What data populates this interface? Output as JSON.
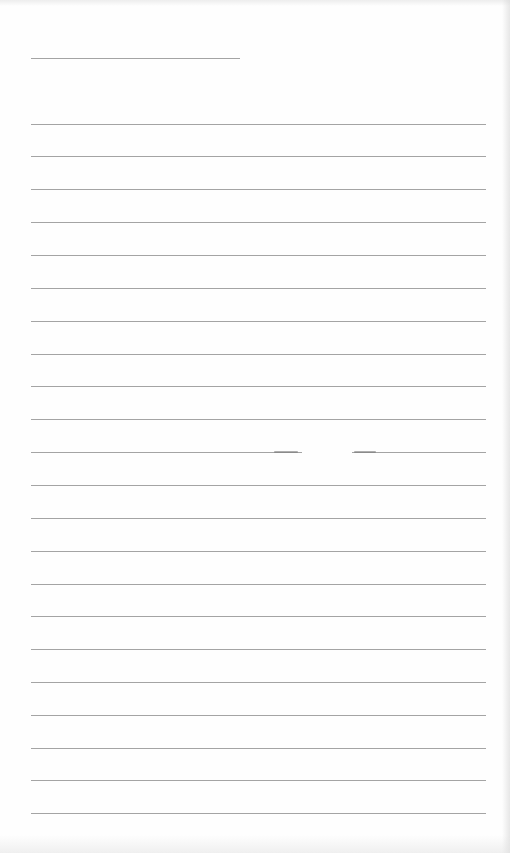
{
  "document": {
    "type": "lined-paper",
    "colors": {
      "background": "#fefefe",
      "rule": "#a4a4a4"
    },
    "header_rule": {
      "y": 58,
      "x_start": 31,
      "x_end": 240
    },
    "rules": [
      {
        "y": 124
      },
      {
        "y": 156
      },
      {
        "y": 189
      },
      {
        "y": 222
      },
      {
        "y": 255
      },
      {
        "y": 288
      },
      {
        "y": 321
      },
      {
        "y": 354
      },
      {
        "y": 386
      },
      {
        "y": 419
      },
      {
        "y": 452,
        "gap": [
          302,
          352
        ]
      },
      {
        "y": 485
      },
      {
        "y": 518
      },
      {
        "y": 551
      },
      {
        "y": 584
      },
      {
        "y": 616
      },
      {
        "y": 649
      },
      {
        "y": 682
      },
      {
        "y": 715
      },
      {
        "y": 748
      },
      {
        "y": 780
      },
      {
        "y": 813
      }
    ],
    "rule_x_start": 31,
    "rule_x_end": 486
  }
}
